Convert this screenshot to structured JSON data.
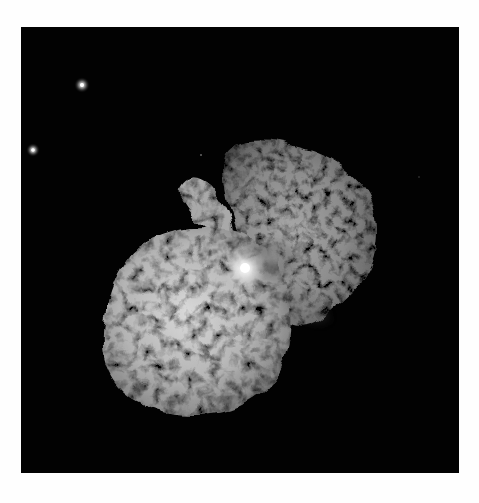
{
  "image": {
    "alt": "Bipolar nebula with two bright lobes around a central star on a black sky",
    "background_color": "#fefefe",
    "panel_color": "#020202",
    "subject": "bipolar-nebula",
    "stars": [
      {
        "x": 61,
        "y": 58,
        "r": 3
      },
      {
        "x": 12,
        "y": 123,
        "r": 3
      }
    ],
    "core": {
      "x": 224,
      "y": 241
    }
  }
}
